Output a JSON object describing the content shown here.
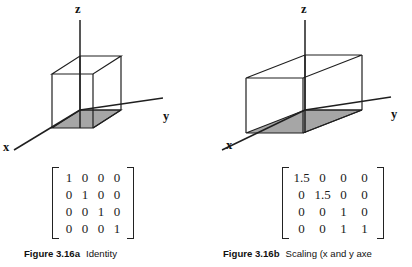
{
  "page": {
    "background_color": "#ffffff",
    "line_color": "#1f1f1f",
    "shaded_face_color": "#a6a6a6"
  },
  "figures": [
    {
      "id": "figure-a",
      "axes": {
        "z_label": "z",
        "y_label": "y",
        "x_label": "x"
      },
      "caption": {
        "label": "Figure 3.16a",
        "text": "Identity"
      },
      "matrix": {
        "name": "identity-matrix",
        "rows": [
          [
            "1",
            "0",
            "0",
            "0"
          ],
          [
            "0",
            "1",
            "0",
            "0"
          ],
          [
            "0",
            "0",
            "1",
            "0"
          ],
          [
            "0",
            "0",
            "0",
            "1"
          ]
        ]
      }
    },
    {
      "id": "figure-b",
      "axes": {
        "z_label": "z",
        "y_label": "y",
        "x_label": "x"
      },
      "caption": {
        "label": "Figure 3.16b",
        "text": "Scaling (x and y axe"
      },
      "matrix": {
        "name": "scaling-matrix",
        "rows": [
          [
            "1.5",
            "0",
            "0",
            "0"
          ],
          [
            "0",
            "1.5",
            "0",
            "0"
          ],
          [
            "0",
            "0",
            "1",
            "0"
          ],
          [
            "0",
            "0",
            "1",
            "1"
          ]
        ]
      }
    }
  ]
}
